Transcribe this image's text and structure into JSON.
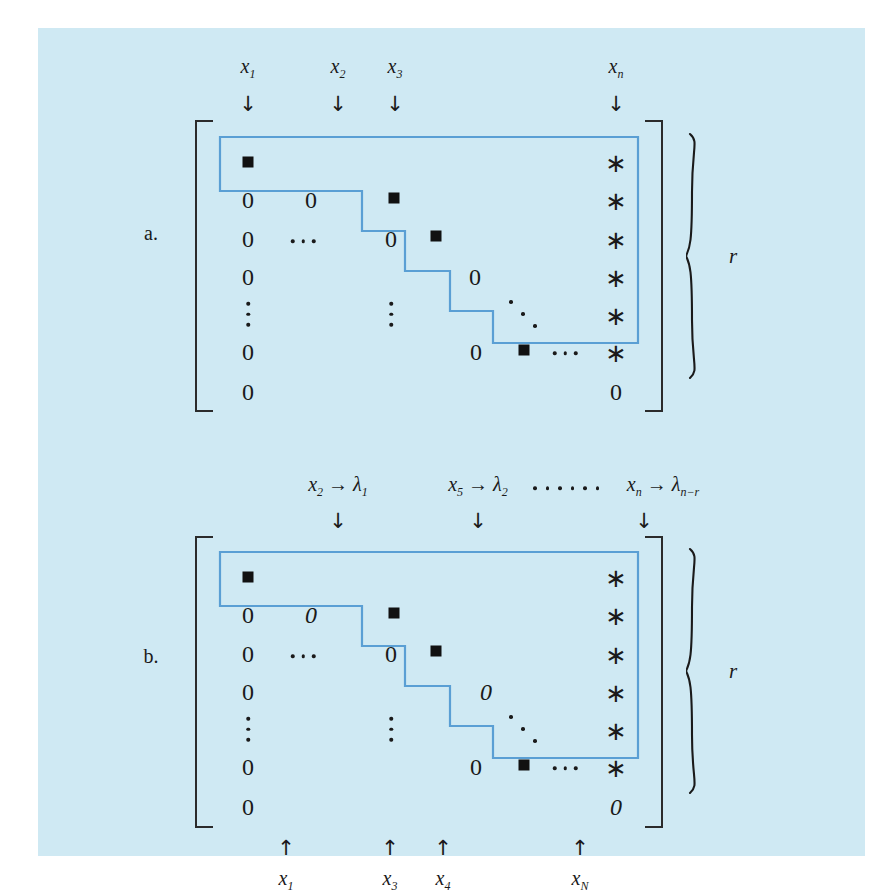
{
  "figure": {
    "panel_bg": "#cfe9f3",
    "outline_color": "#5a9fd4",
    "ink_color": "#1a1a1a"
  },
  "part_a": {
    "part_label": "a.",
    "brace_label": "r",
    "top_labels": [
      {
        "text": "x",
        "sub": "1"
      },
      {
        "text": "x",
        "sub": "2"
      },
      {
        "text": "x",
        "sub": "3"
      },
      {
        "text": "x",
        "sub": "n"
      }
    ],
    "top_arrow": "↓",
    "pivot_glyph": "■",
    "star_glyph": "∗",
    "zero_glyph": "0",
    "rows": [
      {
        "cells": [
          "pivot",
          "",
          "",
          "",
          "star"
        ]
      },
      {
        "cells": [
          "0",
          "0",
          "pivot",
          "",
          "star"
        ]
      },
      {
        "cells": [
          "0",
          "dots",
          "0",
          "pivot",
          "star"
        ]
      },
      {
        "cells": [
          "0",
          "",
          "",
          "0",
          "star"
        ]
      },
      {
        "cells": [
          "vdots",
          "vdots",
          "ddots",
          "",
          "star"
        ]
      },
      {
        "cells": [
          "0",
          "",
          "0",
          "pivot",
          "star"
        ]
      },
      {
        "cells": [
          "0",
          "",
          "",
          "",
          "0"
        ]
      }
    ]
  },
  "part_b": {
    "part_label": "b.",
    "brace_label": "r",
    "top_labels": [
      {
        "var": "x",
        "var_sub": "2",
        "maps_to": "→",
        "lam": "λ",
        "lam_sub": "1"
      },
      {
        "var": "x",
        "var_sub": "5",
        "maps_to": "→",
        "lam": "λ",
        "lam_sub": "2"
      },
      {
        "var": "x",
        "var_sub": "n",
        "maps_to": "→",
        "lam": "λ",
        "lam_sub": "n−r"
      }
    ],
    "top_ellipsis": "······",
    "top_arrow": "↓",
    "bottom_arrow": "↑",
    "bottom_labels": [
      {
        "text": "x",
        "sub": "1"
      },
      {
        "text": "x",
        "sub": "3"
      },
      {
        "text": "x",
        "sub": "4"
      },
      {
        "text": "x",
        "sub": "N"
      }
    ],
    "pivot_glyph": "■",
    "star_glyph": "∗",
    "zero_glyph": "0",
    "zero_italic_glyph": "0",
    "rows": [
      {
        "cells": [
          "pivot",
          "",
          "",
          "",
          "star"
        ]
      },
      {
        "cells": [
          "0",
          "0-italic",
          "pivot",
          "",
          "star"
        ]
      },
      {
        "cells": [
          "0",
          "dots",
          "0",
          "pivot",
          "star"
        ]
      },
      {
        "cells": [
          "0",
          "",
          "",
          "0-italic",
          "star"
        ]
      },
      {
        "cells": [
          "vdots",
          "vdots",
          "ddots",
          "",
          "star"
        ]
      },
      {
        "cells": [
          "0",
          "",
          "0",
          "pivot",
          "star"
        ]
      },
      {
        "cells": [
          "0",
          "",
          "",
          "",
          "0-italic"
        ]
      }
    ]
  }
}
